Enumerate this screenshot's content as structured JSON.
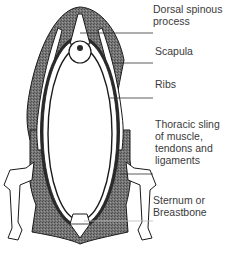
{
  "diagram": {
    "colors": {
      "background": "#ffffff",
      "muscle_fill": "#6e6e6e",
      "outline": "#1a1a1a",
      "bone": "#ffffff",
      "text": "#3a3a3a"
    },
    "labels": [
      {
        "id": "dorsal-spinous-process",
        "text": "Dorsal spinous\nprocess"
      },
      {
        "id": "scapula",
        "text": "Scapula"
      },
      {
        "id": "ribs",
        "text": "Ribs"
      },
      {
        "id": "thoracic-sling",
        "text": "Thoracic sling\nof muscle,\ntendons and\nligaments"
      },
      {
        "id": "sternum",
        "text": "Sternum or\nBreastbone"
      }
    ]
  }
}
